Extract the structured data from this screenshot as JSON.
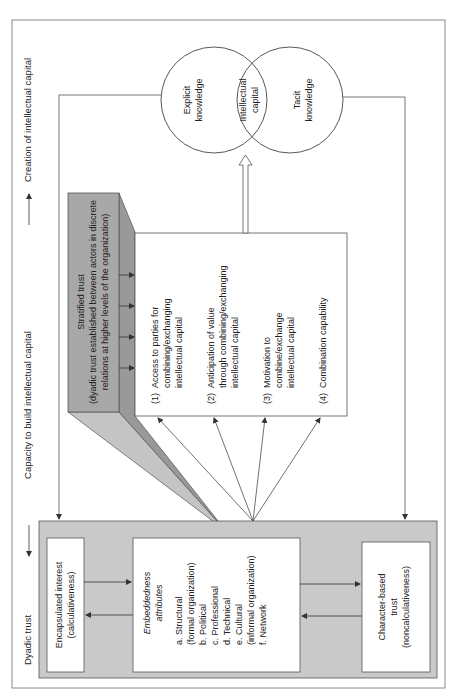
{
  "orientation": "rotated-90-ccw",
  "header": {
    "stage1": "Dyadic trust",
    "stage2": "Capacity to build intellectual capital",
    "stage3": "Creation of intellectual capital"
  },
  "dyadic_box": {
    "encapsulated": {
      "line1": "Encapsulated interest",
      "line2": "(calculativeness)"
    },
    "embeddedness": {
      "title1": "Embeddedness",
      "title2": "attributes",
      "items": [
        "a.  Structural",
        "      (formal organization)",
        "b.  Political",
        "c.  Professional",
        "d.  Technical",
        "e.  Cultural",
        "      (informal organization)",
        "f.  Network"
      ]
    },
    "character": {
      "line1": "Character-based",
      "line2": "trust",
      "line3": "(noncalculativeness)"
    }
  },
  "stratified": {
    "line1": "Stratified trust",
    "line2": "(dyadic trust established between actors in discrete",
    "line3": "relations at higher levels of the organization)"
  },
  "capacity_box": {
    "items": [
      [
        "(1)",
        "Access to parties for",
        "combining/exchanging",
        "intellectual capital"
      ],
      [
        "(2)",
        "Anticipation of value",
        "through combining/exchanging",
        "intellectual capital"
      ],
      [
        "(3)",
        "Motivation to",
        "combine/exchange",
        "intellectual capital"
      ],
      [
        "(4)",
        "Combination capability"
      ]
    ]
  },
  "venn": {
    "left": {
      "line1": "Explicit",
      "line2": "knowledge"
    },
    "center": {
      "line1": "Intellectual",
      "line2": "capital"
    },
    "right": {
      "line1": "Tacit",
      "line2": "knowledge"
    }
  },
  "colors": {
    "dyadic_fill": "#c9c9c9",
    "stratified_fill": "#a8a8a8",
    "wedge_dark": "#999999",
    "wedge_light": "#c4c4c4",
    "stroke": "#555555"
  }
}
